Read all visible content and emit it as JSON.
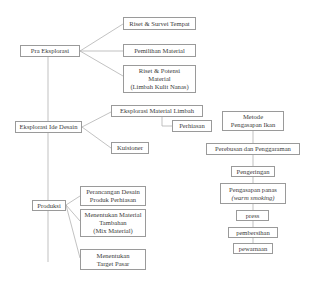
{
  "diagram": {
    "type": "process-flow",
    "line_color": "#a0a0a0",
    "border_color": "#9a9a9a",
    "nodes": {
      "pra_eksplorasi": "Pra Eksplorasi",
      "riset_survei": "Riset & Survei Tempat",
      "pemilihan_material": "Pemilihan Material",
      "riset_potensi": "Riset & Potensi\nMaterial\n(Limbah Kulit Nanas)",
      "eksplorasi_ide": "Eksplorasi Ide Desain",
      "eksplorasi_material": "Eksplorasi Material Limbah",
      "perhiasan": "Perhiasan",
      "kuisioner": "Kuisioner",
      "produksi": "Produksi",
      "perancangan": "Perancangan Desain\nProduk Perhiasan",
      "menentukan_material": "Menentukan Material\nTambahan\n(Mix Material)",
      "menentukan_target": "Menentukan\nTarget Pasar",
      "metode_pengasapan": "Metode\nPengasapan Ikan",
      "perebusan": "Perebusan dan Penggaraman",
      "pengeringan": "Pengeringan",
      "pengasapan_panas_1": "Pengasapan panas",
      "pengasapan_panas_2": "(warm smoking)",
      "press": "press",
      "pembersihan": "pembersihan",
      "pewarnaan": "pewarnaan"
    }
  }
}
